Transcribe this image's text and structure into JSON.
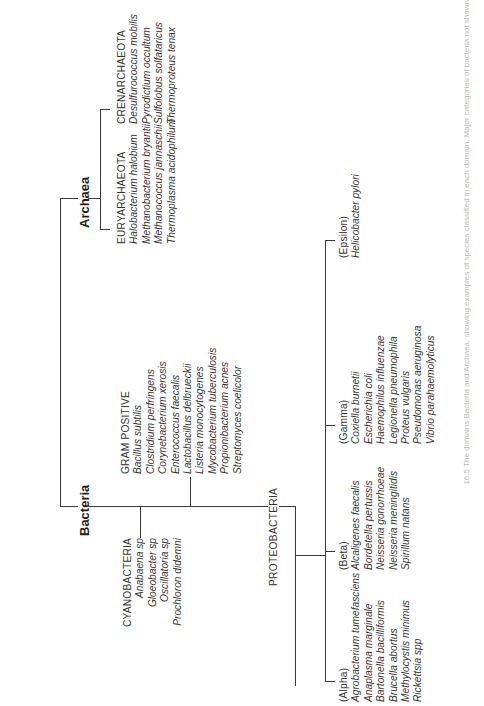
{
  "diagram": {
    "orientation": "rotated-90-ccw",
    "domains": {
      "bacteria": {
        "label": "Bacteria"
      },
      "archaea": {
        "label": "Archaea"
      }
    },
    "bacteria_groups": {
      "cyanobacteria": {
        "heading": "CYANOBACTERIA",
        "species": [
          "Anabaena sp",
          "Gloeobacter sp",
          "Oscillatoria sp",
          "Prochloron didemni"
        ]
      },
      "gram_positive": {
        "heading": "GRAM POSITIVE",
        "species": [
          "Bacillus subtilis",
          "Clostridium perfringens",
          "Corynebacterium xerosis",
          "Enterococcus faecalis",
          "Lactobacillus delbrueckii",
          "Listeria monocytogenes",
          "Mycobacterium tuberculosis",
          "Propionibacterium acnes",
          "Streptomyces coelicolor"
        ]
      },
      "proteobacteria": {
        "label": "PROTEOBACTERIA",
        "subgroups": {
          "alpha": {
            "heading": "(Alpha)",
            "species": [
              "Agrobacterium tumefasciens",
              "Anaplasma marginale",
              "Bartonella bacilliformis",
              "Brucella abortus",
              "Methylocystis minimus",
              "Rickettsia spp"
            ]
          },
          "beta": {
            "heading": "(Beta)",
            "species": [
              "Alcaligenes faecalis",
              "Bordetella pertussis",
              "Neisseria gonorrhoeae",
              "Neisseria meningitidis",
              "Spirillum natans"
            ]
          },
          "gamma": {
            "heading": "(Gamma)",
            "species": [
              "Coxiella burnetii",
              "Escherichia coli",
              "Haemophilus influenzae",
              "Legionella pneumophila",
              "Proteus vulgaris",
              "Pseudomonas aeruginosa",
              "Vibrio parahaemolyticus"
            ]
          },
          "epsilon": {
            "heading": "(Epsilon)",
            "species": [
              "Helicobacter pylori"
            ]
          }
        }
      }
    },
    "archaea_groups": {
      "euryarchaeota": {
        "heading": "EURYARCHAEOTA",
        "species": [
          "Halobacterium halobium",
          "Methanobacterium bryantii",
          "Methanococcus jannaschii",
          "Thermoplasma acidophilum"
        ]
      },
      "crenarchaeota": {
        "heading": "CRENARCHAEOTA",
        "species": [
          "Desulfurococcus mobilis",
          "Pyrodictium occultum",
          "Sulfolobus solfataricus",
          "Thermoproteus tenax"
        ]
      }
    },
    "caption": "16.5 The domains Bacteria and Archaea, showing examples of species classified in each domain. Major categories of bacteria not shown"
  }
}
